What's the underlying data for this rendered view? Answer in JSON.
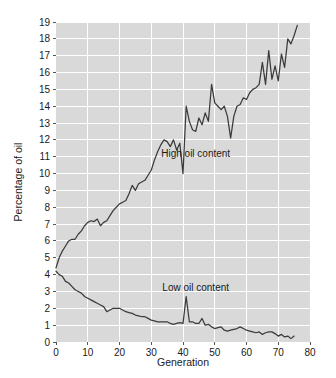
{
  "chart_data": {
    "type": "line",
    "title": "",
    "xlabel": "Generation",
    "ylabel": "Percentage of oil",
    "xlim": [
      0,
      80
    ],
    "ylim": [
      0,
      19
    ],
    "grid": true,
    "legend_position": "inline-annotations",
    "xticks": [
      0,
      10,
      20,
      30,
      40,
      50,
      60,
      70,
      80
    ],
    "xtick_labels": [
      "0",
      "10",
      "20",
      "30",
      "40",
      "50",
      "60",
      "70",
      "80"
    ],
    "yticks": [
      0,
      1,
      2,
      3,
      4,
      5,
      6,
      7,
      8,
      9,
      10,
      11,
      12,
      13,
      14,
      15,
      16,
      17,
      18,
      19
    ],
    "ytick_labels": [
      "0",
      "1",
      "2",
      "3",
      "4",
      "5",
      "6",
      "7",
      "8",
      "9",
      "10",
      "11",
      "12",
      "13",
      "14",
      "15",
      "16",
      "17",
      "18",
      "19"
    ],
    "annotations": [
      {
        "text": "High oil content",
        "x": 44,
        "y": 11.0
      },
      {
        "text": "Low oil content",
        "x": 44,
        "y": 3.0
      }
    ],
    "series": [
      {
        "name": "High oil content",
        "color": "#3b3b3b",
        "x": [
          0,
          1,
          2,
          3,
          4,
          5,
          6,
          7,
          8,
          9,
          10,
          11,
          12,
          13,
          14,
          15,
          16,
          17,
          18,
          19,
          20,
          21,
          22,
          23,
          24,
          25,
          26,
          27,
          28,
          29,
          30,
          31,
          32,
          33,
          34,
          35,
          36,
          37,
          38,
          39,
          40,
          41,
          42,
          43,
          44,
          45,
          46,
          47,
          48,
          49,
          50,
          51,
          52,
          53,
          54,
          55,
          56,
          57,
          58,
          59,
          60,
          61,
          62,
          63,
          64,
          65,
          66,
          67,
          68,
          69,
          70,
          71,
          72,
          73,
          74,
          75,
          76
        ],
        "values": [
          4.4,
          5.0,
          5.4,
          5.7,
          6.0,
          6.1,
          6.1,
          6.4,
          6.6,
          6.9,
          7.1,
          7.2,
          7.15,
          7.3,
          6.9,
          7.1,
          7.2,
          7.5,
          7.8,
          8.0,
          8.2,
          8.3,
          8.4,
          8.8,
          9.3,
          9.0,
          9.4,
          9.5,
          9.6,
          9.9,
          10.2,
          10.8,
          11.3,
          11.7,
          12.0,
          11.9,
          11.6,
          12.0,
          11.4,
          11.8,
          10.0,
          14.0,
          13.1,
          12.6,
          12.5,
          13.3,
          12.9,
          13.6,
          13.1,
          15.3,
          14.2,
          14.0,
          13.8,
          14.0,
          13.4,
          12.1,
          13.4,
          14.0,
          14.1,
          14.5,
          14.4,
          14.8,
          15.0,
          15.1,
          15.3,
          16.6,
          15.3,
          17.3,
          15.6,
          16.4,
          15.5,
          17.1,
          16.3,
          18.0,
          17.7,
          18.2,
          18.8
        ]
      },
      {
        "name": "Low oil content",
        "color": "#3b3b3b",
        "x": [
          0,
          1,
          2,
          3,
          4,
          5,
          6,
          7,
          8,
          9,
          10,
          11,
          12,
          13,
          14,
          15,
          16,
          17,
          18,
          19,
          20,
          21,
          22,
          23,
          24,
          25,
          26,
          27,
          28,
          29,
          30,
          31,
          32,
          33,
          34,
          35,
          36,
          37,
          38,
          39,
          40,
          41,
          42,
          43,
          44,
          45,
          46,
          47,
          48,
          49,
          50,
          51,
          52,
          53,
          54,
          55,
          56,
          57,
          58,
          59,
          60,
          61,
          62,
          63,
          64,
          65,
          66,
          67,
          68,
          69,
          70,
          71,
          72,
          73,
          74,
          75
        ],
        "values": [
          4.2,
          4.0,
          3.9,
          3.6,
          3.5,
          3.3,
          3.1,
          3.0,
          2.9,
          2.7,
          2.6,
          2.5,
          2.4,
          2.3,
          2.2,
          2.1,
          1.8,
          1.9,
          2.0,
          2.0,
          2.0,
          1.9,
          1.8,
          1.75,
          1.7,
          1.6,
          1.55,
          1.5,
          1.5,
          1.4,
          1.3,
          1.25,
          1.2,
          1.2,
          1.2,
          1.2,
          1.1,
          1.05,
          1.1,
          1.15,
          1.1,
          2.7,
          1.2,
          1.2,
          1.1,
          1.1,
          1.4,
          1.0,
          1.05,
          0.9,
          0.8,
          0.85,
          0.9,
          0.7,
          0.65,
          0.7,
          0.75,
          0.8,
          0.9,
          0.8,
          0.7,
          0.65,
          0.6,
          0.55,
          0.6,
          0.45,
          0.55,
          0.6,
          0.6,
          0.5,
          0.35,
          0.45,
          0.3,
          0.35,
          0.2,
          0.35
        ]
      }
    ]
  },
  "axes": {
    "x_title": "Generation",
    "y_title": "Percentage of oil"
  }
}
